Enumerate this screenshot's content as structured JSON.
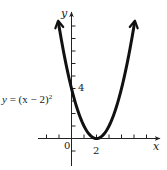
{
  "chart_data": {
    "type": "line",
    "title": "",
    "function": "y = (x - 2)^2",
    "equation_label": {
      "lhs": "y",
      "eq": "=",
      "rhs": "(x − 2)",
      "exponent": "2"
    },
    "xlabel": "x",
    "ylabel": "y",
    "origin_label": "0",
    "x_tick_labels": [
      {
        "value": 2,
        "label": "2"
      }
    ],
    "y_tick_labels": [
      {
        "value": 4,
        "label": "4"
      }
    ],
    "x_ticks": [
      -2,
      -1,
      1,
      2,
      3,
      4,
      5,
      6
    ],
    "y_ticks": [
      -1,
      1,
      2,
      3,
      4,
      5,
      6,
      7,
      8,
      9
    ],
    "xlim": [
      -2.7,
      6.9
    ],
    "ylim": [
      -2.1,
      10.0
    ],
    "vertex": {
      "x": 2,
      "y": 0
    },
    "y_intercept": {
      "x": 0,
      "y": 4
    },
    "curve_ends": [
      {
        "x": -1.05,
        "y": 9.3
      },
      {
        "x": 5.05,
        "y": 9.3
      }
    ],
    "series": [
      {
        "name": "y = (x - 2)^2",
        "x": [
          -1.05,
          -0.5,
          0,
          0.5,
          1,
          1.5,
          2,
          2.5,
          3,
          3.5,
          4,
          4.5,
          5.05
        ],
        "y": [
          9.3,
          6.25,
          4.0,
          2.25,
          1.0,
          0.25,
          0,
          0.25,
          1.0,
          2.25,
          4.0,
          6.25,
          9.3
        ]
      }
    ],
    "arrows": {
      "curve_both_ends": true,
      "x_axis": true,
      "y_axis": true
    },
    "grid": false,
    "legend": null,
    "colors": {
      "curve": "#111111",
      "axes": "#222222",
      "background": "#ffffff"
    }
  }
}
